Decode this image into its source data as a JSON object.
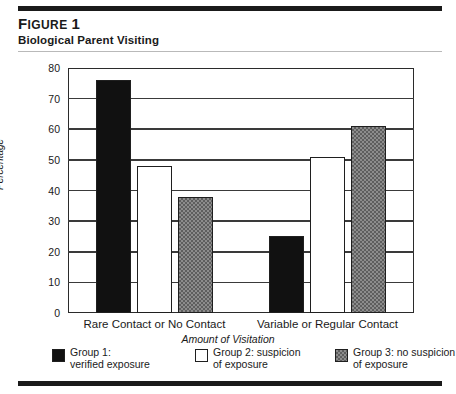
{
  "header": {
    "figure_label_prefix": "F",
    "figure_label_rest": "IGURE",
    "figure_number": "1",
    "subtitle": "Biological Parent Visiting"
  },
  "chart_data": {
    "type": "bar",
    "title": "Biological Parent Visiting",
    "xlabel": "Amount of Visitation",
    "ylabel": "Percentage",
    "ylim": [
      0,
      80
    ],
    "ytick_step": 10,
    "yticks": [
      "80",
      "70",
      "60",
      "50",
      "40",
      "30",
      "20",
      "10",
      "0"
    ],
    "grid": true,
    "legend_position": "bottom",
    "categories": [
      "Rare Contact or No Contact",
      "Variable or Regular Contact"
    ],
    "series": [
      {
        "name": "Group 1: verified exposure",
        "name_line1": "Group 1:",
        "name_line2": "verified exposure",
        "fill": "black",
        "color": "#111111",
        "values": [
          76,
          25
        ]
      },
      {
        "name": "Group 2: suspicion of exposure",
        "name_line1": "Group 2: suspicion",
        "name_line2": "of exposure",
        "fill": "white",
        "color": "#ffffff",
        "values": [
          48,
          51
        ]
      },
      {
        "name": "Group 3: no suspicion of exposure",
        "name_line1": "Group 3: no suspicion",
        "name_line2": "of exposure",
        "fill": "hatched",
        "color": "#8c8c8c",
        "values": [
          38,
          61
        ]
      }
    ]
  }
}
